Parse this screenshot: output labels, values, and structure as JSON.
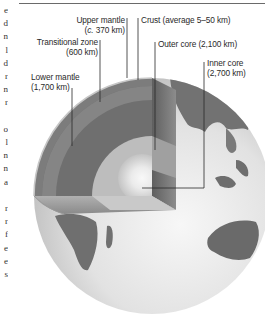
{
  "figure": {
    "labels": [
      {
        "id": "upper-mantle",
        "name": "Upper mantle",
        "value": "(c. 370 km)"
      },
      {
        "id": "crust",
        "name": "Crust (average 5–50 km)"
      },
      {
        "id": "transitional-zone",
        "name": "Transitional zone",
        "value": "(600 km)"
      },
      {
        "id": "outer-core",
        "name": "Outer core (2,100 km)"
      },
      {
        "id": "inner-core",
        "name": "Inner core",
        "value": "(2,700 km)"
      },
      {
        "id": "lower-mantle",
        "name": "Lower mantle",
        "value": "(1,700 km)"
      }
    ],
    "colors": {
      "lower_mantle": "#6f6f6f",
      "transitional_zone": "#8a8a8a",
      "upper_mantle": "#7c7c7c",
      "outer_core": "#b9b9b9",
      "inner_core_glow": "#ffffff",
      "ocean": "#e4e4e4",
      "land": "#666666",
      "leader_line": "#2a2a2a"
    }
  },
  "edge_text": [
    "e",
    "d",
    "n",
    "l",
    "d",
    "r",
    "n",
    "r",
    "",
    "o",
    "l",
    "n",
    "n",
    "a",
    "",
    "r",
    "r",
    "f",
    "e",
    "e",
    "s"
  ]
}
